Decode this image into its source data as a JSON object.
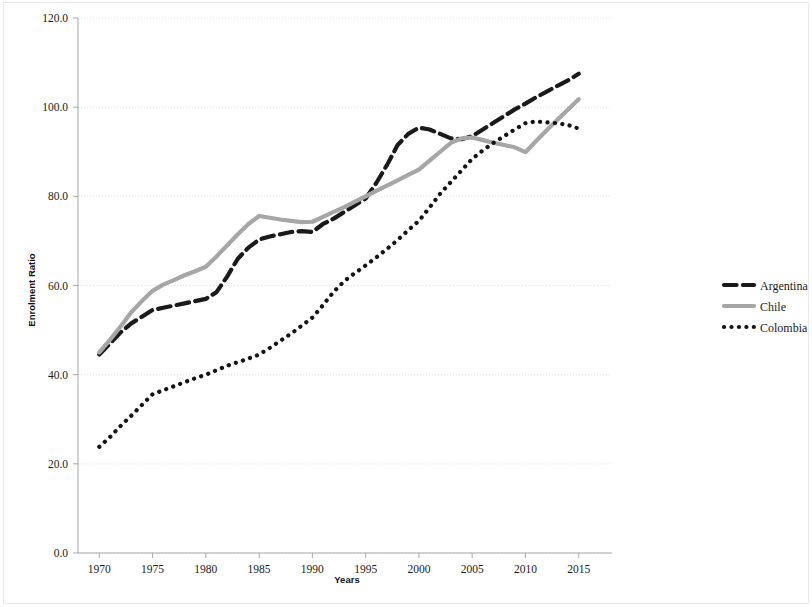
{
  "chart_data": {
    "type": "line",
    "title": "",
    "xlabel": "Years",
    "ylabel": "Enrolment Ratio",
    "xlim": [
      1968,
      2017
    ],
    "ylim": [
      0.0,
      120.0
    ],
    "grid": true,
    "legend_position": "right",
    "x_tick_labels": [
      "1970",
      "1975",
      "1980",
      "1985",
      "1990",
      "1995",
      "2000",
      "2005",
      "2010",
      "2015"
    ],
    "x_ticks": [
      1970,
      1975,
      1980,
      1985,
      1990,
      1995,
      2000,
      2005,
      2010,
      2015
    ],
    "y_tick_labels": [
      "0.0",
      "20.0",
      "40.0",
      "60.0",
      "80.0",
      "100.0",
      "120.0"
    ],
    "y_ticks": [
      0.0,
      20.0,
      40.0,
      60.0,
      80.0,
      100.0,
      120.0
    ],
    "x": [
      1970,
      1971,
      1972,
      1973,
      1974,
      1975,
      1976,
      1977,
      1978,
      1979,
      1980,
      1981,
      1982,
      1983,
      1984,
      1985,
      1986,
      1987,
      1988,
      1989,
      1990,
      1991,
      1992,
      1993,
      1994,
      1995,
      1996,
      1997,
      1998,
      1999,
      2000,
      2001,
      2002,
      2003,
      2004,
      2005,
      2006,
      2007,
      2008,
      2009,
      2010,
      2011,
      2012,
      2013,
      2014,
      2015
    ],
    "series": [
      {
        "name": "Argentina",
        "color": "#1a1a1a",
        "style": "dashed",
        "width": 4.2,
        "values": [
          44.5,
          47.0,
          49.5,
          51.5,
          53.0,
          54.5,
          55.0,
          55.5,
          56.0,
          56.5,
          57.0,
          58.5,
          62.0,
          66.0,
          68.5,
          70.3,
          71.0,
          71.5,
          72.0,
          72.2,
          72.0,
          73.8,
          75.0,
          76.5,
          78.0,
          79.5,
          83.0,
          87.0,
          91.5,
          94.0,
          95.4,
          95.0,
          94.0,
          93.0,
          92.8,
          93.5,
          95.0,
          96.5,
          98.0,
          99.5,
          100.8,
          102.2,
          103.5,
          104.8,
          106.0,
          107.5
        ]
      },
      {
        "name": "Chile",
        "color": "#a6a6a6",
        "style": "solid",
        "width": 4.2,
        "values": [
          45.0,
          47.8,
          50.8,
          54.0,
          56.5,
          58.8,
          60.2,
          61.2,
          62.3,
          63.2,
          64.2,
          66.5,
          69.0,
          71.5,
          73.8,
          75.6,
          75.2,
          74.8,
          74.5,
          74.2,
          74.3,
          75.4,
          76.5,
          77.6,
          78.8,
          80.0,
          81.2,
          82.4,
          83.6,
          84.8,
          86.0,
          88.0,
          90.0,
          92.0,
          93.0,
          93.2,
          92.6,
          92.0,
          91.5,
          91.0,
          89.9,
          92.4,
          94.8,
          97.2,
          99.5,
          101.8
        ]
      },
      {
        "name": "Colombia",
        "color": "#141414",
        "style": "dotted",
        "width": 4.2,
        "values": [
          23.8,
          26.0,
          28.5,
          30.8,
          33.2,
          35.6,
          36.5,
          37.4,
          38.3,
          39.2,
          40.0,
          41.0,
          42.0,
          42.8,
          43.6,
          44.5,
          46.0,
          47.6,
          49.2,
          51.0,
          52.8,
          55.6,
          58.6,
          61.0,
          62.8,
          64.5,
          66.3,
          68.2,
          70.2,
          72.4,
          74.5,
          77.5,
          80.6,
          83.2,
          85.8,
          88.4,
          90.3,
          92.0,
          93.5,
          95.0,
          96.4,
          96.8,
          96.6,
          96.4,
          96.0,
          95.2
        ]
      }
    ]
  },
  "legend": {
    "items": [
      {
        "label": "Argentina"
      },
      {
        "label": "Chile"
      },
      {
        "label": "Colombia"
      }
    ]
  },
  "axes": {
    "x_title": "Years",
    "y_title": "Enrolment Ratio"
  }
}
